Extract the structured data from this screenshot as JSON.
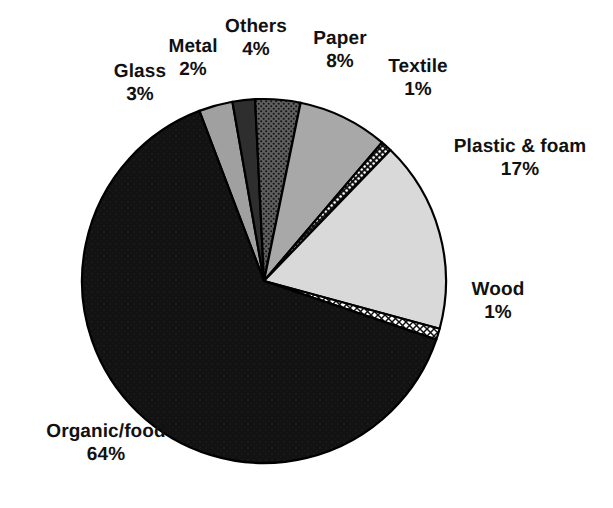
{
  "chart_data": {
    "type": "pie",
    "title": "",
    "subtitle": "",
    "xlabel": "",
    "ylabel": "",
    "legend_position": "none",
    "grid": false,
    "units": "percent",
    "total": 100,
    "start_angle_deg": -90,
    "direction": "clockwise",
    "categories": [
      "Glass",
      "Metal",
      "Others",
      "Paper",
      "Textile",
      "Plastic & foam",
      "Wood",
      "Organic/food"
    ],
    "values": [
      3,
      2,
      4,
      8,
      1,
      17,
      1,
      64
    ],
    "slices": [
      {
        "label": "Glass",
        "value": 3,
        "value_text": "3%",
        "fill": "#a0a0a0",
        "pattern": "solid",
        "label_line1": "Glass",
        "label_line2": "3%"
      },
      {
        "label": "Metal",
        "value": 2,
        "value_text": "2%",
        "fill": "#2e2e2e",
        "pattern": "solid",
        "label_line1": "Metal",
        "label_line2": "2%"
      },
      {
        "label": "Others",
        "value": 4,
        "value_text": "4%",
        "fill": "#6a6a6a",
        "pattern": "stipple",
        "label_line1": "Others",
        "label_line2": "4%"
      },
      {
        "label": "Paper",
        "value": 8,
        "value_text": "8%",
        "fill": "#a8a8a8",
        "pattern": "solid",
        "label_line1": "Paper",
        "label_line2": "8%"
      },
      {
        "label": "Textile",
        "value": 1,
        "value_text": "1%",
        "fill": "#1a1a1a",
        "pattern": "dots-white",
        "label_line1": "Textile",
        "label_line2": "1%"
      },
      {
        "label": "Plastic & foam",
        "value": 17,
        "value_text": "17%",
        "fill": "#d9d9d9",
        "pattern": "solid",
        "label_line1": "Plastic  &  foam",
        "label_line2": "17%"
      },
      {
        "label": "Wood",
        "value": 1,
        "value_text": "1%",
        "fill": "#ffffff",
        "pattern": "crosshatch",
        "label_line1": "Wood",
        "label_line2": "1%"
      },
      {
        "label": "Organic/food",
        "value": 64,
        "value_text": "64%",
        "fill": "#141414",
        "pattern": "solid",
        "label_line1": "Organic/food",
        "label_line2": "64%"
      }
    ]
  },
  "labels": {
    "glass": {
      "name": "Glass",
      "value": "3%"
    },
    "metal": {
      "name": "Metal",
      "value": "2%"
    },
    "others": {
      "name": "Others",
      "value": "4%"
    },
    "paper": {
      "name": "Paper",
      "value": "8%"
    },
    "textile": {
      "name": "Textile",
      "value": "1%"
    },
    "plastic": {
      "name": "Plastic  &  foam",
      "value": "17%"
    },
    "wood": {
      "name": "Wood",
      "value": "1%"
    },
    "organic": {
      "name": "Organic/food",
      "value": "64%"
    }
  },
  "colors": {
    "background": "#ffffff",
    "outline": "#000000",
    "text": "#111111"
  },
  "geometry": {
    "center_x": 264,
    "center_y": 281,
    "radius": 182
  }
}
